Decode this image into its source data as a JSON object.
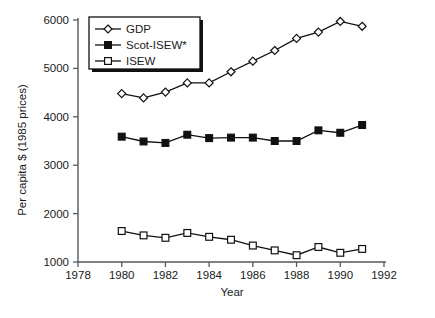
{
  "chart_data": {
    "type": "line",
    "title": "",
    "xlabel": "Year",
    "ylabel": "Per capita $ (1985 prices)",
    "xlim": [
      1978,
      1992
    ],
    "ylim": [
      1000,
      6000
    ],
    "xticks": [
      1978,
      1980,
      1982,
      1984,
      1986,
      1988,
      1990,
      1992
    ],
    "yticks": [
      1000,
      2000,
      3000,
      4000,
      5000,
      6000
    ],
    "grid": false,
    "legend_position": "top-left",
    "x": [
      1980,
      1981,
      1982,
      1983,
      1984,
      1985,
      1986,
      1987,
      1988,
      1989,
      1990,
      1991
    ],
    "series": [
      {
        "name": "GDP",
        "marker": "open-diamond",
        "values": [
          4480,
          4390,
          4510,
          4700,
          4700,
          4930,
          5150,
          5370,
          5620,
          5750,
          5970,
          5870
        ]
      },
      {
        "name": "Scot-ISEW*",
        "marker": "filled-square",
        "values": [
          3590,
          3490,
          3460,
          3630,
          3560,
          3570,
          3570,
          3500,
          3500,
          3720,
          3670,
          3830
        ]
      },
      {
        "name": "ISEW",
        "marker": "open-square",
        "values": [
          1640,
          1550,
          1500,
          1600,
          1520,
          1460,
          1340,
          1240,
          1140,
          1310,
          1190,
          1270
        ]
      }
    ]
  },
  "legend": {
    "items": [
      {
        "label": "GDP"
      },
      {
        "label": "Scot-ISEW*"
      },
      {
        "label": "ISEW"
      }
    ]
  },
  "axes": {
    "x_title": "Year",
    "y_title": "Per capita $ (1985 prices)",
    "x_tick_labels": [
      "1978",
      "1980",
      "1982",
      "1984",
      "1986",
      "1988",
      "1990",
      "1992"
    ],
    "y_tick_labels": [
      "1000",
      "2000",
      "3000",
      "4000",
      "5000",
      "6000"
    ]
  },
  "colors": {
    "ink": "#111111",
    "axis": "#55595c",
    "background": "#ffffff"
  }
}
